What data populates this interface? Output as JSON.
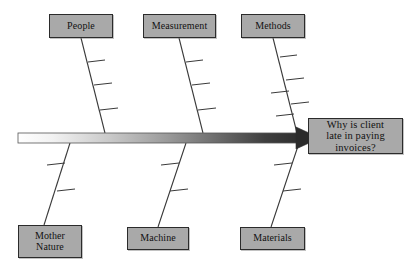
{
  "diagram": {
    "type": "fishbone-ishikawa",
    "effect": {
      "label": "Why is client\nlate in paying\ninvoices?",
      "box": {
        "x": 308,
        "y": 118,
        "w": 95,
        "h": 36
      }
    },
    "spine": {
      "x1": 18,
      "x2": 305,
      "y": 138,
      "thickness": 10,
      "gradient_from": "#ffffff",
      "gradient_to": "#2f2f2f",
      "arrow_color": "#2b2b2b"
    },
    "colors": {
      "box_fill": "#a9a9a9",
      "box_border": "#2b2b2b",
      "bone_line": "#3a3a3a",
      "text": "#111111",
      "background": "#ffffff"
    },
    "categories": [
      {
        "id": "people",
        "label": "People",
        "side": "top",
        "box": {
          "x": 49,
          "y": 14,
          "w": 64,
          "h": 24
        },
        "bone": {
          "x1": 81,
          "y1": 38,
          "x2": 105,
          "y2": 133
        },
        "ticks": [
          {
            "x1": 88,
            "y1": 62,
            "x2": 105,
            "y2": 60,
            "dir": "right"
          },
          {
            "x1": 94,
            "y1": 85,
            "x2": 112,
            "y2": 83,
            "dir": "right"
          },
          {
            "x1": 100,
            "y1": 110,
            "x2": 118,
            "y2": 108,
            "dir": "right"
          }
        ]
      },
      {
        "id": "measurement",
        "label": "Measurement",
        "side": "top",
        "box": {
          "x": 143,
          "y": 14,
          "w": 73,
          "h": 24
        },
        "bone": {
          "x1": 179,
          "y1": 38,
          "x2": 203,
          "y2": 133
        },
        "ticks": [
          {
            "x1": 186,
            "y1": 62,
            "x2": 203,
            "y2": 60,
            "dir": "right"
          },
          {
            "x1": 192,
            "y1": 85,
            "x2": 210,
            "y2": 83,
            "dir": "right"
          },
          {
            "x1": 198,
            "y1": 110,
            "x2": 216,
            "y2": 108,
            "dir": "right"
          }
        ]
      },
      {
        "id": "methods",
        "label": "Methods",
        "side": "top",
        "box": {
          "x": 241,
          "y": 14,
          "w": 64,
          "h": 24
        },
        "bone": {
          "x1": 273,
          "y1": 38,
          "x2": 297,
          "y2": 133
        },
        "ticks": [
          {
            "x1": 280,
            "y1": 57,
            "x2": 297,
            "y2": 55,
            "dir": "right"
          },
          {
            "x1": 286,
            "y1": 80,
            "x2": 304,
            "y2": 78,
            "dir": "right"
          },
          {
            "x1": 271,
            "y1": 93,
            "x2": 289,
            "y2": 91,
            "dir": "left"
          },
          {
            "x1": 291,
            "y1": 104,
            "x2": 309,
            "y2": 102,
            "dir": "right"
          },
          {
            "x1": 276,
            "y1": 116,
            "x2": 294,
            "y2": 114,
            "dir": "left"
          }
        ]
      },
      {
        "id": "mother-nature",
        "label": "Mother\nNature",
        "side": "bottom",
        "box": {
          "x": 18,
          "y": 225,
          "w": 64,
          "h": 33
        },
        "bone": {
          "x1": 70,
          "y1": 143,
          "x2": 44,
          "y2": 225
        },
        "ticks": [
          {
            "x1": 47,
            "y1": 165,
            "x2": 65,
            "y2": 163,
            "dir": "left"
          },
          {
            "x1": 57,
            "y1": 191,
            "x2": 75,
            "y2": 189,
            "dir": "left"
          }
        ]
      },
      {
        "id": "machine",
        "label": "Machine",
        "side": "bottom",
        "box": {
          "x": 127,
          "y": 227,
          "w": 62,
          "h": 23
        },
        "bone": {
          "x1": 186,
          "y1": 143,
          "x2": 158,
          "y2": 227
        },
        "ticks": [
          {
            "x1": 161,
            "y1": 165,
            "x2": 179,
            "y2": 163,
            "dir": "left"
          },
          {
            "x1": 170,
            "y1": 191,
            "x2": 188,
            "y2": 189,
            "dir": "left"
          }
        ]
      },
      {
        "id": "materials",
        "label": "Materials",
        "side": "bottom",
        "box": {
          "x": 240,
          "y": 227,
          "w": 65,
          "h": 23
        },
        "bone": {
          "x1": 299,
          "y1": 143,
          "x2": 271,
          "y2": 227
        },
        "ticks": [
          {
            "x1": 274,
            "y1": 165,
            "x2": 292,
            "y2": 163,
            "dir": "left"
          },
          {
            "x1": 283,
            "y1": 191,
            "x2": 301,
            "y2": 189,
            "dir": "left"
          }
        ]
      }
    ]
  }
}
